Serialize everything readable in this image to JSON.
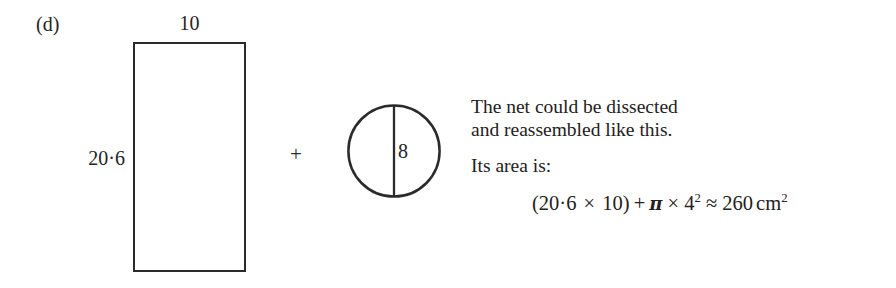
{
  "figure": {
    "part_label": "(d)",
    "rectangle": {
      "top_label": "10",
      "side_label": "20·6"
    },
    "operator": "+",
    "circle": {
      "chord_label": "8"
    }
  },
  "explanation": {
    "line1": "The net could be dissected",
    "line2": "and reassembled like this.",
    "line3": "Its area is:"
  },
  "formula": {
    "open_paren": "(",
    "length": "20·6",
    "times1": "×",
    "width": "10",
    "close_paren": ")",
    "plus": "+",
    "pi": "π",
    "times2": "×",
    "radius": "4",
    "radius_exponent": "2",
    "approx": "≈",
    "result": "260",
    "unit": "cm",
    "unit_exponent": "2",
    "full_text": "(20·6 × 10) + π × 4² ≈ 260 cm²"
  },
  "style": {
    "background": "#ffffff",
    "ink": "#242121",
    "stroke": "#2b2b2b"
  }
}
